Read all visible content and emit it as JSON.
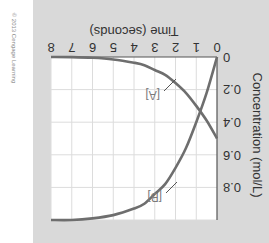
{
  "chart_data": {
    "type": "line",
    "title": "",
    "xlabel": "Time (seconds)",
    "ylabel": "Concentration (mol/L)",
    "xlim": [
      0,
      8
    ],
    "ylim": [
      0,
      1.0
    ],
    "x_ticks": [
      "0",
      "1",
      "2",
      "3",
      "4",
      "5",
      "6",
      "7",
      "8"
    ],
    "y_ticks": [
      "0",
      "0.2",
      "0.4",
      "0.6",
      "0.8"
    ],
    "grid": true,
    "orientation": "image rotated 180 degrees",
    "x": [
      0,
      0.5,
      1,
      1.5,
      2,
      2.5,
      3,
      3.5,
      4,
      5,
      6,
      7,
      8
    ],
    "series": [
      {
        "name": "[A]",
        "values": [
          0.5,
          0.39,
          0.3,
          0.22,
          0.16,
          0.11,
          0.08,
          0.05,
          0.035,
          0.015,
          0.005,
          0.001,
          0.0
        ],
        "color": "#6e6e6e"
      },
      {
        "name": "[B]",
        "values": [
          0.0,
          0.22,
          0.4,
          0.56,
          0.68,
          0.78,
          0.84,
          0.9,
          0.93,
          0.97,
          0.99,
          1.0,
          1.0
        ],
        "color": "#6e6e6e"
      }
    ],
    "annotations": [
      "[A]",
      "[B]"
    ],
    "legend": "inline labels with leader lines"
  },
  "labels": {
    "x_axis_title": "Time (seconds)",
    "y_axis_title": "Concentration (mol/L)",
    "series_a": "[A]",
    "series_b": "[B]",
    "credit": "© 2013 Cengage Learning",
    "x_ticks": [
      "0",
      "1",
      "2",
      "3",
      "4",
      "5",
      "6",
      "7",
      "8"
    ],
    "y_ticks": [
      "0",
      "0.2",
      "0.4",
      "0.6",
      "0.8"
    ]
  },
  "colors": {
    "panel_bg": "#d9d9d9",
    "plot_bg": "#ffffff",
    "grid": "#dcdcdc",
    "curve": "#6e6e6e",
    "axis": "#555555"
  }
}
